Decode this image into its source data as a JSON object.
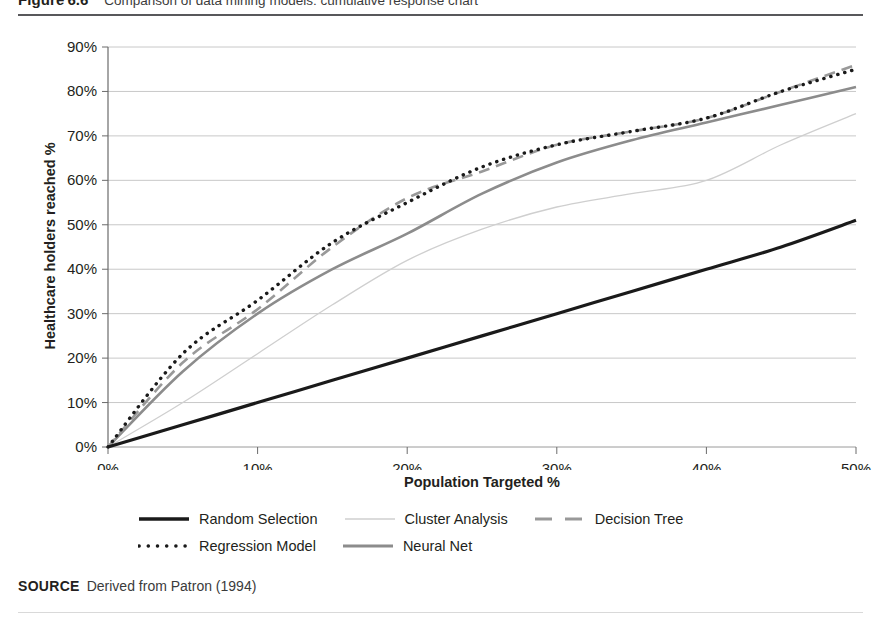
{
  "figure": {
    "label": "Figure",
    "number": "6.6",
    "title": "Comparison of data mining models: cumulative response chart"
  },
  "source": {
    "keyword": "SOURCE",
    "text": "Derived from Patron (1994)"
  },
  "axes": {
    "x_title": "Population Targeted %",
    "y_title": "Healthcare holders reached %",
    "x_ticks": [
      "0%",
      "10%",
      "20%",
      "30%",
      "40%",
      "50%"
    ],
    "y_ticks": [
      "0%",
      "10%",
      "20%",
      "30%",
      "40%",
      "50%",
      "60%",
      "70%",
      "80%",
      "90%"
    ]
  },
  "legend": {
    "rows": [
      [
        {
          "label": "Random Selection",
          "style": "solid-black",
          "color": "#1a1a1a"
        },
        {
          "label": "Cluster Analysis",
          "style": "solid-light",
          "color": "#cfcfcf"
        },
        {
          "label": "Decision Tree",
          "style": "dashed-gray",
          "color": "#999999"
        }
      ],
      [
        {
          "label": "Regression Model",
          "style": "dotted-black",
          "color": "#1a1a1a"
        },
        {
          "label": "Neural Net",
          "style": "solid-gray",
          "color": "#8c8c8c"
        }
      ]
    ]
  },
  "chart_data": {
    "type": "line",
    "title": "Comparison of data mining models: cumulative response chart",
    "xlabel": "Population Targeted %",
    "ylabel": "Healthcare holders reached %",
    "xlim": [
      0,
      50
    ],
    "ylim": [
      0,
      90
    ],
    "xtick_values": [
      0,
      10,
      20,
      30,
      40,
      50
    ],
    "ytick_values": [
      0,
      10,
      20,
      30,
      40,
      50,
      60,
      70,
      80,
      90
    ],
    "grid": "horizontal",
    "legend_position": "bottom",
    "x": [
      0,
      5,
      10,
      15,
      20,
      25,
      30,
      35,
      40,
      45,
      50
    ],
    "series": [
      {
        "name": "Random Selection",
        "style": "solid-black",
        "color": "#1a1a1a",
        "values": [
          0,
          5,
          10,
          15,
          20,
          25,
          30,
          35,
          40,
          45,
          51
        ]
      },
      {
        "name": "Cluster Analysis",
        "style": "solid-light",
        "color": "#cfcfcf",
        "values": [
          0,
          10,
          21,
          32,
          42,
          49,
          54,
          57,
          60,
          68,
          75
        ]
      },
      {
        "name": "Decision Tree",
        "style": "dashed-gray",
        "color": "#999999",
        "values": [
          0,
          19,
          31,
          45,
          56,
          62,
          68,
          71,
          74,
          80,
          86
        ]
      },
      {
        "name": "Regression Model",
        "style": "dotted-black",
        "color": "#1a1a1a",
        "values": [
          0,
          21,
          33,
          46,
          55,
          63,
          68,
          71,
          74,
          80,
          85
        ]
      },
      {
        "name": "Neural Net",
        "style": "solid-gray",
        "color": "#8c8c8c",
        "values": [
          0,
          17,
          30,
          40,
          48,
          57,
          64,
          69,
          73,
          77,
          81
        ]
      }
    ]
  }
}
